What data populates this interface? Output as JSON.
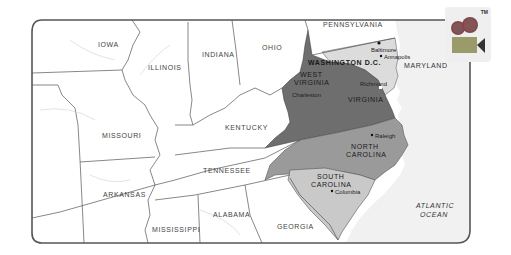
{
  "map": {
    "title": "",
    "states": {
      "iowa": "IOWA",
      "illinois": "ILLINOIS",
      "indiana": "INDIANA",
      "ohio": "OHIO",
      "pennsylvania": "PENNSYLVANIA",
      "washington_dc": "WASHINGTON D.C.",
      "maryland": "MARYLAND",
      "west_virginia_line1": "WEST",
      "west_virginia_line2": "VIRGINIA",
      "virginia": "VIRGINIA",
      "kentucky": "KENTUCKY",
      "missouri": "MISSOURI",
      "tennessee": "TENNESSEE",
      "north_carolina_line1": "NORTH",
      "north_carolina_line2": "CAROLINA",
      "south_carolina_line1": "SOUTH",
      "south_carolina_line2": "CAROLINA",
      "arkansas": "ARKANSAS",
      "alabama": "ALABAMA",
      "mississippi": "MISSISSIPPI",
      "georgia": "GEORGIA"
    },
    "cities": {
      "baltimore": "Baltimore",
      "annapolis": "Annapolis",
      "richmond": "Richmond",
      "charleston": "Charleston",
      "raleigh": "Raleigh",
      "columbia": "Columbia"
    },
    "ocean": {
      "line1": "ATLANTIC",
      "line2": "OCEAN"
    },
    "colors": {
      "virginia_wv": "#6e6e6e",
      "north_carolina": "#9a9a9a",
      "south_carolina": "#c9c9c9",
      "maryland": "#dcdcdc",
      "ocean": "#f1f1f1",
      "land": "#ffffff",
      "border": "#555555"
    }
  },
  "badge": {
    "icon": "video-camera-icon",
    "trademark": "TM"
  }
}
